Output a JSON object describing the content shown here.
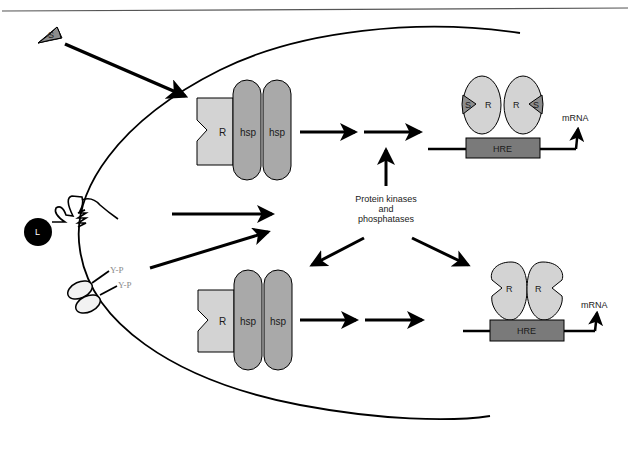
{
  "diagram": {
    "colors": {
      "receptor_fill": "#d3d3d3",
      "hsp_fill": "#a9a9a9",
      "hre_fill": "#7a7a7a",
      "steroid_fill": "#8c8c8c",
      "ligand_fill": "#000000",
      "line": "#000000",
      "yp_text": "#8a8a8a"
    },
    "labels": {
      "steroid": "S",
      "ligand": "L",
      "yp1": "Y-P",
      "yp2": "Y-P",
      "kinases_line1": "Protein kinases",
      "kinases_line2": "and",
      "kinases_line3": "phosphatases"
    },
    "top_complex": {
      "receptor": "R",
      "hsp1": "hsp",
      "hsp2": "hsp"
    },
    "bottom_complex": {
      "receptor": "R",
      "hsp1": "hsp",
      "hsp2": "hsp"
    },
    "top_dimer": {
      "steroid_left": "S",
      "receptor_left": "R",
      "receptor_right": "R",
      "steroid_right": "S",
      "element": "HRE",
      "product": "mRNA"
    },
    "bottom_dimer": {
      "receptor_left": "R",
      "receptor_right": "R",
      "element": "HRE",
      "product": "mRNA"
    }
  }
}
